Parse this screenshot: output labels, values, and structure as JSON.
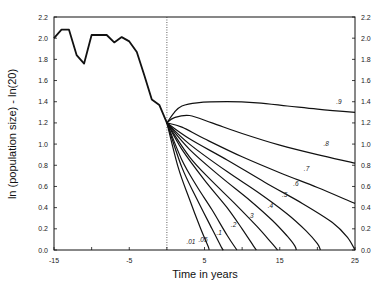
{
  "chart_data": {
    "type": "line",
    "title": "",
    "xlabel": "Time in years",
    "ylabel": "ln (population size) - ln(20)",
    "xlim": [
      -15,
      25
    ],
    "ylim": [
      0.0,
      2.2
    ],
    "x_ticks": [
      -15,
      -5,
      5,
      15,
      25
    ],
    "x_tick_labels": [
      "-15",
      "-5",
      "5",
      "15",
      "25"
    ],
    "y_ticks": [
      0.0,
      0.2,
      0.4,
      0.6,
      0.8,
      1.0,
      1.2,
      1.4,
      1.6,
      1.8,
      2.0,
      2.2
    ],
    "y_tick_labels": [
      "0.0",
      "0.2",
      "0.4",
      "0.6",
      "0.8",
      "1.0",
      "1.2",
      "1.4",
      "1.6",
      "1.8",
      "2.0",
      "2.2"
    ],
    "right_axis_mirrors_left": true,
    "grid": false,
    "reference_line": {
      "x": 0,
      "style": "dotted"
    },
    "observed": {
      "name": "observed",
      "x": [
        -15,
        -14,
        -13,
        -12,
        -11,
        -10,
        -9,
        -8,
        -7,
        -6,
        -5,
        -4,
        -3,
        -2,
        -1,
        0
      ],
      "y": [
        2.0,
        2.08,
        2.08,
        1.84,
        1.76,
        2.03,
        2.03,
        2.03,
        1.96,
        2.01,
        1.97,
        1.87,
        1.65,
        1.42,
        1.37,
        1.2
      ]
    },
    "series": [
      {
        "name": ".9",
        "x": [
          0,
          1,
          2,
          4,
          8,
          12,
          16,
          20,
          25
        ],
        "y": [
          1.2,
          1.3,
          1.36,
          1.39,
          1.4,
          1.39,
          1.36,
          1.33,
          1.3
        ],
        "label_at": [
          22.5,
          1.38
        ]
      },
      {
        "name": ".8",
        "x": [
          0,
          1,
          3,
          6,
          10,
          15,
          20,
          25
        ],
        "y": [
          1.2,
          1.25,
          1.27,
          1.2,
          1.1,
          0.99,
          0.9,
          0.82
        ],
        "label_at": [
          20.8,
          0.98
        ]
      },
      {
        "name": ".7",
        "x": [
          0,
          2,
          5,
          10,
          15,
          20,
          25
        ],
        "y": [
          1.2,
          1.16,
          1.05,
          0.88,
          0.73,
          0.59,
          0.44
        ],
        "label_at": [
          18.2,
          0.75
        ]
      },
      {
        "name": ".6",
        "x": [
          0,
          3,
          8,
          13,
          18,
          22,
          24,
          25
        ],
        "y": [
          1.2,
          1.05,
          0.85,
          0.64,
          0.44,
          0.26,
          0.12,
          0.0
        ],
        "label_at": [
          16.8,
          0.6
        ]
      },
      {
        "name": ".5",
        "x": [
          0,
          3,
          8,
          12,
          16,
          18.5,
          20,
          20.4
        ],
        "y": [
          1.2,
          1.0,
          0.74,
          0.55,
          0.34,
          0.18,
          0.06,
          0.0
        ],
        "label_at": [
          15.3,
          0.5
        ]
      },
      {
        "name": ".4",
        "x": [
          0,
          3,
          7,
          11,
          14,
          16,
          17,
          17.2
        ],
        "y": [
          1.2,
          0.95,
          0.7,
          0.47,
          0.28,
          0.13,
          0.04,
          0.0
        ],
        "label_at": [
          13.4,
          0.4
        ]
      },
      {
        "name": ".3",
        "x": [
          0,
          3,
          6,
          9,
          12,
          14,
          14.7
        ],
        "y": [
          1.2,
          0.88,
          0.65,
          0.44,
          0.22,
          0.06,
          0.0
        ],
        "label_at": [
          10.8,
          0.3
        ]
      },
      {
        "name": ".2",
        "x": [
          0,
          2,
          5,
          8,
          10,
          11.5,
          11.9
        ],
        "y": [
          1.2,
          0.95,
          0.66,
          0.4,
          0.2,
          0.04,
          0.0
        ],
        "label_at": [
          8.5,
          0.22
        ]
      },
      {
        "name": ".1",
        "x": [
          0,
          2,
          4,
          6,
          8,
          9.3
        ],
        "y": [
          1.2,
          0.85,
          0.6,
          0.38,
          0.14,
          0.0
        ],
        "label_at": [
          6.6,
          0.14
        ]
      },
      {
        "name": ".05",
        "x": [
          0,
          2,
          4,
          6,
          7.3,
          7.5
        ],
        "y": [
          1.2,
          0.78,
          0.48,
          0.2,
          0.02,
          0.0
        ],
        "label_at": [
          4.2,
          0.08
        ]
      },
      {
        "name": ".01",
        "x": [
          0,
          1.5,
          3,
          4.5,
          5.5,
          5.6
        ],
        "y": [
          1.2,
          0.78,
          0.48,
          0.2,
          0.03,
          0.0
        ],
        "label_at": [
          2.6,
          0.06
        ]
      }
    ]
  }
}
